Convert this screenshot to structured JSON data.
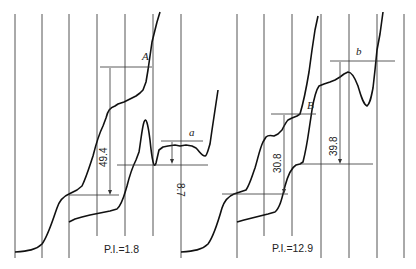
{
  "figure": {
    "type": "polarogram",
    "panels": [
      {
        "id": "left",
        "caption": "P.I.=1.8",
        "wave_label_upper": "A",
        "wave_label_lower": "a",
        "height_A": "49.4",
        "height_a": "8.7"
      },
      {
        "id": "right",
        "caption": "P.I.=12.9",
        "wave_label_upper": "B",
        "wave_label_lower": "b",
        "height_B": "30.8",
        "height_b": "39.8"
      }
    ],
    "colors": {
      "ink": "#111111",
      "grid": "#2a2a2a",
      "background": "#ffffff"
    }
  }
}
